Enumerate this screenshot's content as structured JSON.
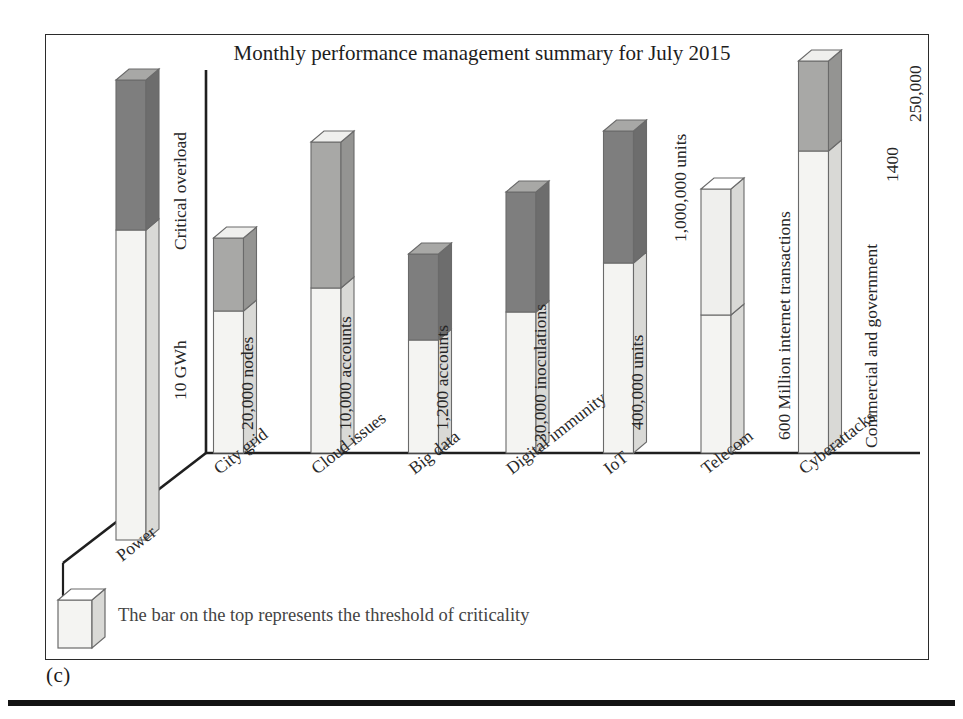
{
  "figure": {
    "caption": "(c)",
    "title": "Monthly performance management summary for July 2015"
  },
  "legend": {
    "swatch_name": "threshold-cube",
    "text": "The bar on the top represents the threshold of criticality"
  },
  "axis": {
    "label_top": "Critical overload",
    "label_bottom": "10 GWh"
  },
  "colors": {
    "bar_base": "#f4f4f2",
    "bar_base_side": "#d9d9d6",
    "cap_dark": "#7e7e7e",
    "cap_dark_side": "#6d6d6d",
    "cap_mid": "#a8a8a6",
    "cap_mid_side": "#949492",
    "cap_light": "#efefed",
    "outline": "#6a6a6a",
    "axis": "#1f1f1f",
    "frame": "#2b2b2b",
    "rule": "#141414"
  },
  "chart_data": {
    "type": "bar",
    "title": "Monthly performance management summary for July 2015",
    "xlabel": "",
    "ylabel": "Critical overload / 10 GWh",
    "grid": false,
    "legend_position": "bottom-left",
    "note": "3D stacked column chart; light lower segment is the measured value, the shaded cap on top represents the threshold of criticality",
    "categories": [
      "Power",
      "City grid",
      "Cloud issues",
      "Big data",
      "Digital immunity",
      "IoT",
      "Telecom",
      "Cyberattacks"
    ],
    "series": [
      {
        "name": "Value",
        "values": [
          223,
          142,
          165,
          113,
          141,
          190,
          138,
          302
        ]
      },
      {
        "name": "Threshold of criticality",
        "values": [
          150,
          73,
          146,
          86,
          120,
          132,
          126,
          90
        ]
      }
    ],
    "cap_shades": [
      "dark",
      "mid",
      "mid",
      "dark",
      "dark",
      "dark",
      "light",
      "mid"
    ],
    "value_labels": [
      {
        "category": "Power",
        "labels": [
          "10 GWh"
        ]
      },
      {
        "category": "City grid",
        "labels": [
          "20,000 nodes"
        ]
      },
      {
        "category": "Cloud issues",
        "labels": [
          "10,000 accounts"
        ]
      },
      {
        "category": "Big data",
        "labels": [
          "1,200 accounts"
        ]
      },
      {
        "category": "Digital immunity",
        "labels": [
          "30,000 inoculations"
        ]
      },
      {
        "category": "IoT",
        "labels": [
          "400,000 units",
          "1,000,000 units"
        ]
      },
      {
        "category": "Telecom",
        "labels": [
          "600 Million internet transactions"
        ]
      },
      {
        "category": "Cyberattacks",
        "labels": [
          "Commercial and government",
          "1400",
          "250,000"
        ]
      }
    ]
  }
}
